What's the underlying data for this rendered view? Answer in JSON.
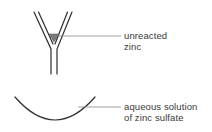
{
  "diagram": {
    "colors": {
      "line": "#2e2e2e",
      "leader": "#8a8a8a",
      "zinc": "#7a7a7a",
      "text": "#3a3a3a"
    },
    "labels": {
      "zinc": {
        "line1": "unreacted",
        "line2": "zinc"
      },
      "solution": {
        "line1": "aqueous solution",
        "line2": "of zinc sulfate"
      }
    }
  }
}
